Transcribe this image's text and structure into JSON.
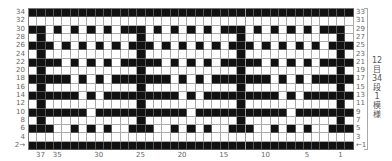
{
  "chart": {
    "columns": 39,
    "rows": 17,
    "repeat_label": [
      "12",
      "目",
      "34",
      "段",
      "1",
      "模",
      "様"
    ],
    "repeat_text": "12目34段1模様",
    "start_marker_left": "2→",
    "start_marker_right": "←1",
    "left_row_labels": [
      "34",
      "32",
      "30",
      "28",
      "26",
      "24",
      "22",
      "20",
      "18",
      "16",
      "14",
      "12",
      "10",
      "8",
      "6",
      "4",
      "2"
    ],
    "right_row_labels": [
      "33",
      "31",
      "29",
      "27",
      "25",
      "23",
      "21",
      "19",
      "17",
      "15",
      "13",
      "11",
      "9",
      "7",
      "5",
      "3",
      "1"
    ],
    "bottom_col_labels": [
      {
        "label": "37",
        "index": 1
      },
      {
        "label": "35",
        "index": 3
      },
      {
        "label": "30",
        "index": 8
      },
      {
        "label": "25",
        "index": 13
      },
      {
        "label": "20",
        "index": 18
      },
      {
        "label": "15",
        "index": 23
      },
      {
        "label": "10",
        "index": 28
      },
      {
        "label": "5",
        "index": 33
      },
      {
        "label": "1",
        "index": 37
      }
    ],
    "repeat_separator_index": 26,
    "colors": {
      "filled": "#111111",
      "empty": "#ffffff",
      "grid": "#aaaaaa"
    },
    "repeat_pattern": [
      "BBBBBBBBBBBB",
      "WWWWWWWWWWWW",
      "BBWBWBWBWBWB",
      "WBWWWWWWWWWW",
      "BBBWBWBWBWBW",
      "WBWWWWWWWWWW",
      "BBBBWBWBWBWB",
      "WBWWWWWWWWWW",
      "BBBBBWBWBWBB",
      "WBWWWWWWWWWW",
      "BBBBBBWBWBBB",
      "WBWWWWWWWWWW",
      "BBBBBBBWBBBB",
      "WBWWWWWWWWWW",
      "BBBWWBWBWBWW",
      "WWWWWWWWWWWW",
      "BBBBBBBBBBBB"
    ]
  }
}
